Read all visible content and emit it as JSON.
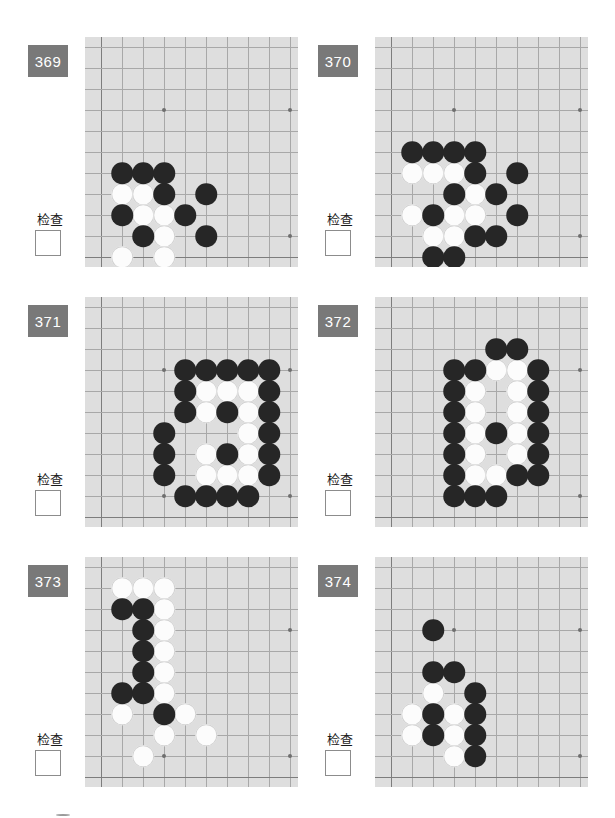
{
  "page": {
    "check_label": "检查",
    "badge_color": "#797979",
    "board_color": "#dedede",
    "grid_color": "#a8a8a8",
    "black_color": "#262626",
    "white_color": "#fcfcfc"
  },
  "board": {
    "cols": 10,
    "rows": 10,
    "cell": 21,
    "star_points": [
      [
        3,
        3
      ],
      [
        9,
        3
      ],
      [
        3,
        9
      ],
      [
        9,
        9
      ]
    ]
  },
  "puzzles": [
    {
      "number": "369",
      "check_label": "检查",
      "black": [
        [
          1,
          6
        ],
        [
          2,
          6
        ],
        [
          3,
          6
        ],
        [
          3,
          7
        ],
        [
          5,
          7
        ],
        [
          1,
          8
        ],
        [
          4,
          8
        ],
        [
          2,
          9
        ],
        [
          5,
          9
        ]
      ],
      "white": [
        [
          1,
          7
        ],
        [
          2,
          7
        ],
        [
          2,
          8
        ],
        [
          3,
          8
        ],
        [
          3,
          9
        ],
        [
          1,
          10
        ],
        [
          3,
          10
        ]
      ]
    },
    {
      "number": "370",
      "check_label": "检查",
      "black": [
        [
          1,
          5
        ],
        [
          2,
          5
        ],
        [
          3,
          5
        ],
        [
          4,
          5
        ],
        [
          4,
          6
        ],
        [
          6,
          6
        ],
        [
          3,
          7
        ],
        [
          5,
          7
        ],
        [
          2,
          8
        ],
        [
          6,
          8
        ],
        [
          4,
          9
        ],
        [
          5,
          9
        ],
        [
          2,
          10
        ],
        [
          3,
          10
        ]
      ],
      "white": [
        [
          1,
          6
        ],
        [
          2,
          6
        ],
        [
          3,
          6
        ],
        [
          4,
          7
        ],
        [
          1,
          8
        ],
        [
          3,
          8
        ],
        [
          4,
          8
        ],
        [
          2,
          9
        ],
        [
          3,
          9
        ]
      ]
    },
    {
      "number": "371",
      "check_label": "检查",
      "black": [
        [
          4,
          3
        ],
        [
          5,
          3
        ],
        [
          6,
          3
        ],
        [
          7,
          3
        ],
        [
          8,
          3
        ],
        [
          4,
          4
        ],
        [
          8,
          4
        ],
        [
          4,
          5
        ],
        [
          6,
          5
        ],
        [
          8,
          5
        ],
        [
          3,
          6
        ],
        [
          8,
          6
        ],
        [
          3,
          7
        ],
        [
          6,
          7
        ],
        [
          8,
          7
        ],
        [
          3,
          8
        ],
        [
          8,
          8
        ],
        [
          4,
          9
        ],
        [
          5,
          9
        ],
        [
          6,
          9
        ],
        [
          7,
          9
        ]
      ],
      "white": [
        [
          5,
          4
        ],
        [
          6,
          4
        ],
        [
          7,
          4
        ],
        [
          5,
          5
        ],
        [
          7,
          5
        ],
        [
          7,
          6
        ],
        [
          5,
          7
        ],
        [
          7,
          7
        ],
        [
          5,
          8
        ],
        [
          6,
          8
        ],
        [
          7,
          8
        ]
      ]
    },
    {
      "number": "372",
      "check_label": "检查",
      "black": [
        [
          5,
          2
        ],
        [
          6,
          2
        ],
        [
          3,
          3
        ],
        [
          4,
          3
        ],
        [
          7,
          3
        ],
        [
          3,
          4
        ],
        [
          7,
          4
        ],
        [
          3,
          5
        ],
        [
          7,
          5
        ],
        [
          3,
          6
        ],
        [
          5,
          6
        ],
        [
          7,
          6
        ],
        [
          3,
          7
        ],
        [
          7,
          7
        ],
        [
          3,
          8
        ],
        [
          6,
          8
        ],
        [
          7,
          8
        ],
        [
          3,
          9
        ],
        [
          4,
          9
        ],
        [
          5,
          9
        ]
      ],
      "white": [
        [
          5,
          3
        ],
        [
          6,
          3
        ],
        [
          4,
          4
        ],
        [
          6,
          4
        ],
        [
          4,
          5
        ],
        [
          6,
          5
        ],
        [
          4,
          6
        ],
        [
          6,
          6
        ],
        [
          4,
          7
        ],
        [
          6,
          7
        ],
        [
          4,
          8
        ],
        [
          5,
          8
        ]
      ]
    },
    {
      "number": "373",
      "check_label": "检查",
      "black": [
        [
          1,
          2
        ],
        [
          2,
          2
        ],
        [
          2,
          3
        ],
        [
          2,
          4
        ],
        [
          2,
          5
        ],
        [
          1,
          6
        ],
        [
          2,
          6
        ],
        [
          3,
          7
        ]
      ],
      "white": [
        [
          1,
          1
        ],
        [
          2,
          1
        ],
        [
          3,
          1
        ],
        [
          3,
          2
        ],
        [
          3,
          3
        ],
        [
          3,
          4
        ],
        [
          3,
          5
        ],
        [
          3,
          6
        ],
        [
          1,
          7
        ],
        [
          4,
          7
        ],
        [
          3,
          8
        ],
        [
          5,
          8
        ],
        [
          2,
          9
        ]
      ]
    },
    {
      "number": "374",
      "check_label": "检查",
      "black": [
        [
          2,
          3
        ],
        [
          2,
          5
        ],
        [
          3,
          5
        ],
        [
          4,
          6
        ],
        [
          2,
          7
        ],
        [
          4,
          7
        ],
        [
          2,
          8
        ],
        [
          4,
          8
        ],
        [
          4,
          9
        ]
      ],
      "white": [
        [
          2,
          6
        ],
        [
          1,
          7
        ],
        [
          3,
          7
        ],
        [
          1,
          8
        ],
        [
          3,
          8
        ],
        [
          3,
          9
        ]
      ]
    }
  ]
}
